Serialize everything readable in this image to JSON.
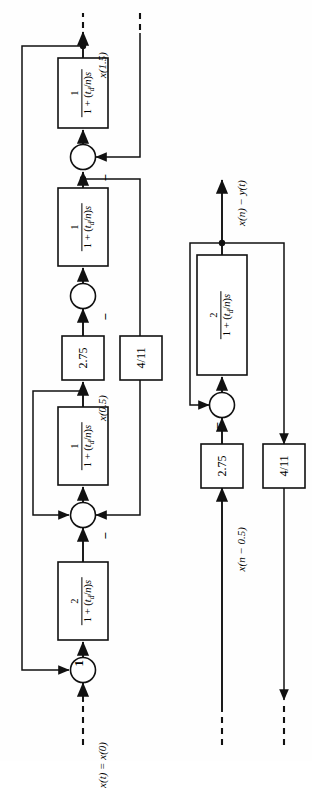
{
  "figure": {
    "orientation": "rotated-90-ccw",
    "ink_color": "#111111",
    "paper_color": "#fefefe"
  },
  "labels": {
    "input_left": "x(t) = x(0)",
    "mid_left": "x(0.5)",
    "output_left": "x(1.5)",
    "input_right": "x(n − 0.5)",
    "output_right": "x(n) − y(t)",
    "minus": "−",
    "one": "1"
  },
  "blocks": [
    {
      "id": "left-lag-1",
      "kind": "transfer-function",
      "numerator": "2",
      "denominator_prefix": "1 + (",
      "denominator_tau": "t",
      "denominator_tau_sub": "d",
      "denominator_suffix": "/n)s",
      "text": "2 / (1 + (td/n)s)"
    },
    {
      "id": "left-lag-2",
      "kind": "transfer-function",
      "numerator": "1",
      "denominator_prefix": "1 + (",
      "denominator_tau": "t",
      "denominator_tau_sub": "d",
      "denominator_suffix": "/n)s",
      "text": "1 / (1 + (td/n)s)"
    },
    {
      "id": "left-gain-275",
      "kind": "gain",
      "text": "2.75"
    },
    {
      "id": "left-lag-3",
      "kind": "transfer-function",
      "numerator": "1",
      "denominator_prefix": "1 + (",
      "denominator_tau": "t",
      "denominator_tau_sub": "d",
      "denominator_suffix": "/n)s",
      "text": "1 / (1 + (td/n)s)"
    },
    {
      "id": "left-lag-4",
      "kind": "transfer-function",
      "numerator": "1",
      "denominator_prefix": "1 + (",
      "denominator_tau": "t",
      "denominator_tau_sub": "d",
      "denominator_suffix": "/n)s",
      "text": "1 / (1 + (td/n)s)"
    },
    {
      "id": "left-feedback-411",
      "kind": "gain",
      "text": "4/11"
    },
    {
      "id": "right-gain-275",
      "kind": "gain",
      "text": "2.75"
    },
    {
      "id": "right-lag-1",
      "kind": "transfer-function",
      "numerator": "2",
      "denominator_prefix": "1 + (",
      "denominator_tau": "t",
      "denominator_tau_sub": "d",
      "denominator_suffix": "/n)s",
      "text": "2 / (1 + (td/n)s)"
    },
    {
      "id": "right-feedback-411",
      "kind": "gain",
      "text": "4/11"
    }
  ],
  "summing_junctions": [
    {
      "id": "sum-left-1",
      "signs": [
        "+",
        "1"
      ]
    },
    {
      "id": "sum-left-2",
      "signs": [
        "+",
        "−"
      ]
    },
    {
      "id": "sum-left-3",
      "signs": [
        "+",
        "−"
      ]
    },
    {
      "id": "sum-right-1",
      "signs": [
        "+",
        "−"
      ]
    }
  ],
  "gain_values": {
    "forward_gain": "2.75",
    "feedback_gain": "4/11",
    "lag_numerator_first": "2",
    "lag_numerator_rest": "1"
  }
}
